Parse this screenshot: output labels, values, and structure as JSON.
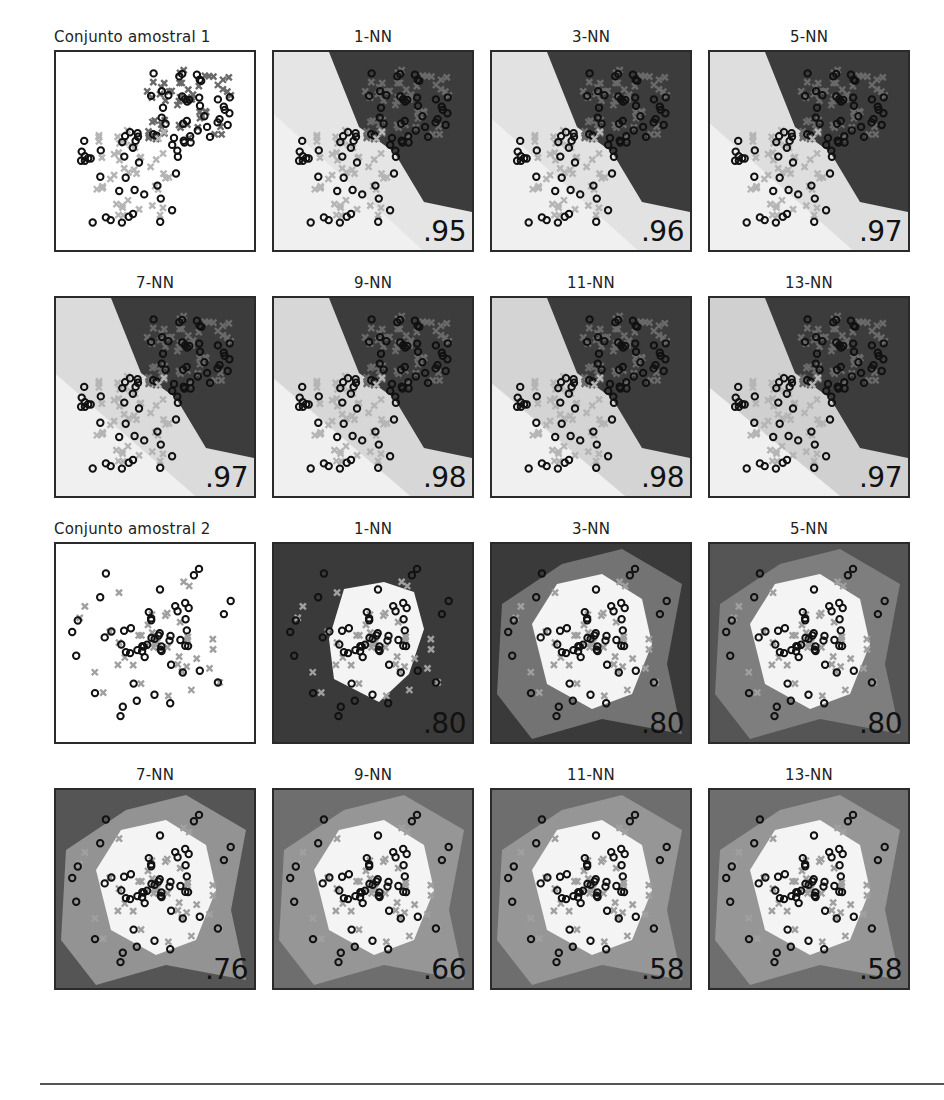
{
  "figure": {
    "rows": [
      {
        "panels": [
          {
            "title": "Conjunto amostral 1",
            "score": "",
            "kind": "data1"
          },
          {
            "title": "1-NN",
            "score": ".95",
            "kind": "b1",
            "k": 1
          },
          {
            "title": "3-NN",
            "score": ".96",
            "kind": "b1",
            "k": 3
          },
          {
            "title": "5-NN",
            "score": ".97",
            "kind": "b1",
            "k": 5
          }
        ]
      },
      {
        "panels": [
          {
            "title": "7-NN",
            "score": ".97",
            "kind": "b1",
            "k": 7
          },
          {
            "title": "9-NN",
            "score": ".98",
            "kind": "b1",
            "k": 9
          },
          {
            "title": "11-NN",
            "score": ".98",
            "kind": "b1",
            "k": 11
          },
          {
            "title": "13-NN",
            "score": ".97",
            "kind": "b1",
            "k": 13
          }
        ]
      },
      {
        "panels": [
          {
            "title": "Conjunto amostral 2",
            "score": "",
            "kind": "data2"
          },
          {
            "title": "1-NN",
            "score": ".80",
            "kind": "b2",
            "k": 1
          },
          {
            "title": "3-NN",
            "score": ".80",
            "kind": "b2",
            "k": 3
          },
          {
            "title": "5-NN",
            "score": ".80",
            "kind": "b2",
            "k": 5
          }
        ]
      },
      {
        "panels": [
          {
            "title": "7-NN",
            "score": ".76",
            "kind": "b2",
            "k": 7
          },
          {
            "title": "9-NN",
            "score": ".66",
            "kind": "b2",
            "k": 9
          },
          {
            "title": "11-NN",
            "score": ".58",
            "kind": "b2",
            "k": 11
          },
          {
            "title": "13-NN",
            "score": ".58",
            "kind": "b2",
            "k": 13
          }
        ]
      }
    ]
  },
  "chart_data": [
    {
      "type": "scatter",
      "title": "Conjunto amostral 1 — k-NN decision regions",
      "legend": [
        "class circle (dark)",
        "class cross (light)"
      ],
      "categories": [
        "1-NN",
        "3-NN",
        "5-NN",
        "7-NN",
        "9-NN",
        "11-NN",
        "13-NN"
      ],
      "series": [
        {
          "name": "accuracy",
          "values": [
            0.95,
            0.96,
            0.97,
            0.97,
            0.98,
            0.98,
            0.97
          ]
        }
      ]
    },
    {
      "type": "scatter",
      "title": "Conjunto amostral 2 — k-NN decision regions",
      "legend": [
        "class circle (dark)",
        "class cross (light)"
      ],
      "categories": [
        "1-NN",
        "3-NN",
        "5-NN",
        "7-NN",
        "9-NN",
        "11-NN",
        "13-NN"
      ],
      "series": [
        {
          "name": "accuracy",
          "values": [
            0.8,
            0.8,
            0.8,
            0.76,
            0.66,
            0.58,
            0.58
          ]
        }
      ]
    }
  ],
  "colors": {
    "dark_region": "#3c3c3c",
    "light_region": "#f2f2f2",
    "mid_region": "#8a8a8a",
    "point_ring": "#111111",
    "cross": "#9a9a9a"
  }
}
